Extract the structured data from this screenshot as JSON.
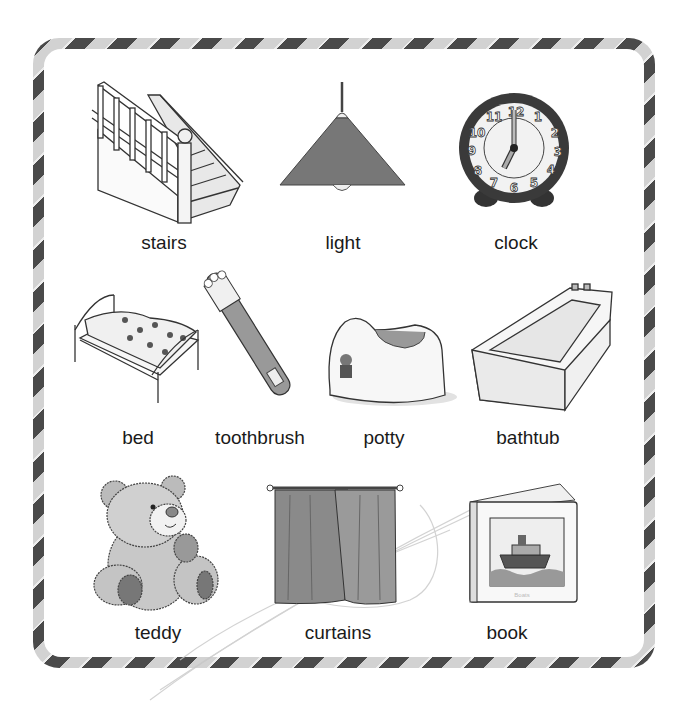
{
  "page": {
    "border_colors": {
      "dark": "#4a4a4a",
      "light": "#d2d2d2"
    }
  },
  "items": [
    {
      "label": "stairs",
      "icon": "stairs-illustration"
    },
    {
      "label": "light",
      "icon": "pendant-lamp-illustration"
    },
    {
      "label": "clock",
      "icon": "alarm-clock-illustration"
    },
    {
      "label": "bed",
      "icon": "bed-illustration"
    },
    {
      "label": "toothbrush",
      "icon": "toothbrush-illustration"
    },
    {
      "label": "potty",
      "icon": "potty-illustration"
    },
    {
      "label": "bathtub",
      "icon": "bathtub-illustration"
    },
    {
      "label": "teddy",
      "icon": "teddy-bear-illustration"
    },
    {
      "label": "curtains",
      "icon": "curtains-illustration"
    },
    {
      "label": "book",
      "icon": "picture-book-illustration"
    }
  ],
  "clock": {
    "numbers": [
      "12",
      "1",
      "2",
      "3",
      "4",
      "5",
      "6",
      "7",
      "8",
      "9",
      "10",
      "11"
    ],
    "time_shown": "7:00"
  },
  "book": {
    "cover_text": "Boats"
  }
}
